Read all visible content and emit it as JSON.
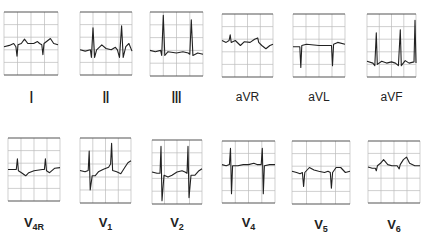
{
  "figure": {
    "limb_leads": [
      {
        "id": "I",
        "label": "I",
        "x": 4,
        "y": 12,
        "w": 54,
        "h": 63,
        "label_x": 4,
        "label_y": 88
      },
      {
        "id": "II",
        "label": "II",
        "x": 80,
        "y": 12,
        "w": 52,
        "h": 63,
        "label_x": 80,
        "label_y": 88
      },
      {
        "id": "III",
        "label": "III",
        "x": 150,
        "y": 12,
        "w": 53,
        "h": 64,
        "label_x": 150,
        "label_y": 88
      },
      {
        "id": "aVR",
        "label": "aVR",
        "x": 222,
        "y": 14,
        "w": 51,
        "h": 63,
        "label_x": 222,
        "label_y": 90
      },
      {
        "id": "aVL",
        "label": "aVL",
        "x": 293,
        "y": 14,
        "w": 52,
        "h": 63,
        "label_x": 293,
        "label_y": 90
      },
      {
        "id": "aVF",
        "label": "aVF",
        "x": 367,
        "y": 14,
        "w": 49,
        "h": 63,
        "label_x": 367,
        "label_y": 90
      }
    ],
    "chest_leads": [
      {
        "id": "V4R",
        "base": "V",
        "sub": "4R",
        "x": 8,
        "y": 138,
        "w": 52,
        "h": 63,
        "label_x": 8,
        "label_y": 215
      },
      {
        "id": "V1",
        "base": "V",
        "sub": "1",
        "x": 80,
        "y": 138,
        "w": 51,
        "h": 65,
        "label_x": 80,
        "label_y": 215
      },
      {
        "id": "V2",
        "base": "V",
        "sub": "2",
        "x": 152,
        "y": 140,
        "w": 50,
        "h": 64,
        "label_x": 152,
        "label_y": 215
      },
      {
        "id": "V4",
        "base": "V",
        "sub": "4",
        "x": 222,
        "y": 141,
        "w": 53,
        "h": 62,
        "label_x": 222,
        "label_y": 215
      },
      {
        "id": "V5",
        "base": "V",
        "sub": "5",
        "x": 292,
        "y": 141,
        "w": 58,
        "h": 63,
        "label_x": 292,
        "label_y": 217
      },
      {
        "id": "V6",
        "base": "V",
        "sub": "6",
        "x": 368,
        "y": 141,
        "w": 52,
        "h": 62,
        "label_x": 368,
        "label_y": 217
      }
    ]
  }
}
